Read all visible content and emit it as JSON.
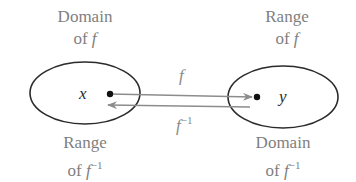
{
  "diagram": {
    "left_set": {
      "top_label": {
        "line1": "Domain",
        "line2_prefix": "of ",
        "line2_var": "f",
        "line2_sup": ""
      },
      "bottom_label": {
        "line1": "Range",
        "line2_prefix": "of ",
        "line2_var": "f",
        "line2_sup": "−1"
      },
      "element": "x"
    },
    "right_set": {
      "top_label": {
        "line1": "Range",
        "line2_prefix": "of ",
        "line2_var": "f",
        "line2_sup": ""
      },
      "bottom_label": {
        "line1": "Domain",
        "line2_prefix": "of ",
        "line2_var": "f",
        "line2_sup": "−1"
      },
      "element": "y"
    },
    "arrows": [
      {
        "label_var": "f",
        "label_sup": "",
        "direction": "x-to-y"
      },
      {
        "label_var": "f",
        "label_sup": "−1",
        "direction": "y-to-x"
      }
    ],
    "colors": {
      "outline": "#2b2b2b",
      "arrow": "#8c8c8c",
      "text": "#7f7f7f",
      "point": "#111111"
    }
  }
}
